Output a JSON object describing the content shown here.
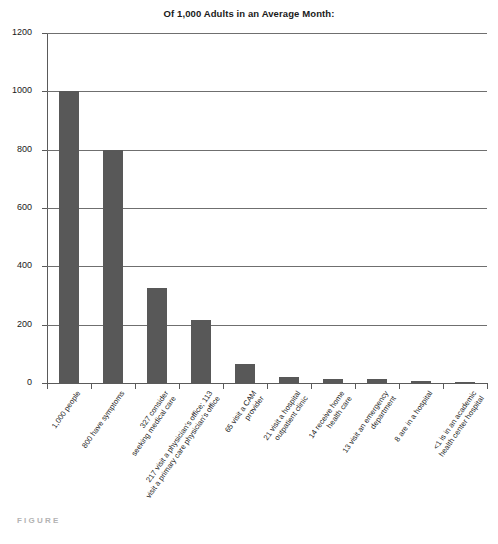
{
  "chart_data": {
    "type": "bar",
    "title": "Of 1,000 Adults in an Average Month:",
    "xlabel": "",
    "ylabel": "",
    "ylim": [
      0,
      1200
    ],
    "yticks": [
      0,
      200,
      400,
      600,
      800,
      1000,
      1200
    ],
    "grid": true,
    "legend": null,
    "bar_color": "#585858",
    "categories": [
      "1,000 people",
      "800 have symptoms",
      "327 consider\nseeking medical care",
      "217 visit a physician's office; 113\nvisit a primary care physician's office",
      "65 visit a CAM\nprovider",
      "21 visit a hospital\noutpatient clinic",
      "14 receive home\nhealth care",
      "13 visit an emergency\ndepartment",
      "8 are in a hospital",
      "<1 is in an academic\nhealth center hospital"
    ],
    "values": [
      1000,
      800,
      327,
      217,
      65,
      21,
      14,
      13,
      8,
      0.5
    ],
    "value_labels": [
      "1,000",
      "800",
      "327",
      "217",
      "65",
      "21",
      "14",
      "13",
      "8",
      "<1"
    ]
  },
  "footer": {
    "caption": "FIGURE"
  }
}
